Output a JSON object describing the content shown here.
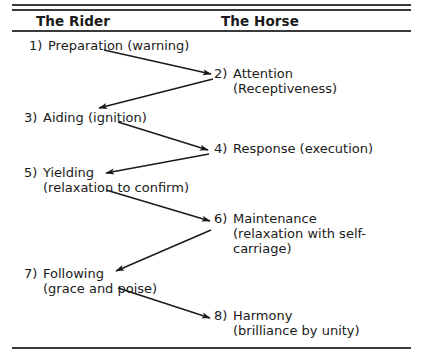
{
  "diagram": {
    "columns": [
      {
        "key": "rider",
        "label": "The Rider"
      },
      {
        "key": "horse",
        "label": "The Horse"
      }
    ],
    "steps": [
      {
        "num": "1)",
        "column": "rider",
        "lines": [
          "Preparation (warning)"
        ]
      },
      {
        "num": "2)",
        "column": "horse",
        "lines": [
          "Attention",
          "(Receptiveness)"
        ]
      },
      {
        "num": "3)",
        "column": "rider",
        "lines": [
          "Aiding  (ignition)"
        ]
      },
      {
        "num": "4)",
        "column": "horse",
        "lines": [
          "Response (execution)"
        ]
      },
      {
        "num": "5)",
        "column": "rider",
        "lines": [
          "Yielding",
          "(relaxation to confirm)"
        ]
      },
      {
        "num": "6)",
        "column": "horse",
        "lines": [
          "Maintenance",
          "(relaxation with self-",
          "carriage)"
        ]
      },
      {
        "num": "7)",
        "column": "rider",
        "lines": [
          "Following",
          "(grace and poise)"
        ]
      },
      {
        "num": "8)",
        "column": "horse",
        "lines": [
          "Harmony",
          "(brilliance by unity)"
        ]
      }
    ],
    "arrows": [
      {
        "from": "1",
        "to": "2",
        "x1": 104,
        "y1": 50,
        "x2": 211,
        "y2": 74
      },
      {
        "from": "2",
        "to": "3",
        "x1": 213,
        "y1": 79,
        "x2": 99,
        "y2": 108
      },
      {
        "from": "3",
        "to": "4",
        "x1": 118,
        "y1": 122,
        "x2": 208,
        "y2": 150
      },
      {
        "from": "4",
        "to": "5",
        "x1": 209,
        "y1": 154,
        "x2": 106,
        "y2": 173
      },
      {
        "from": "5",
        "to": "6",
        "x1": 106,
        "y1": 190,
        "x2": 210,
        "y2": 221
      },
      {
        "from": "6",
        "to": "7",
        "x1": 211,
        "y1": 230,
        "x2": 116,
        "y2": 271
      },
      {
        "from": "7",
        "to": "8",
        "x1": 118,
        "y1": 288,
        "x2": 210,
        "y2": 318
      }
    ],
    "colors": {
      "ink": "#1a1a1a",
      "rule": "#3a3a3a",
      "background": "#ffffff"
    }
  }
}
